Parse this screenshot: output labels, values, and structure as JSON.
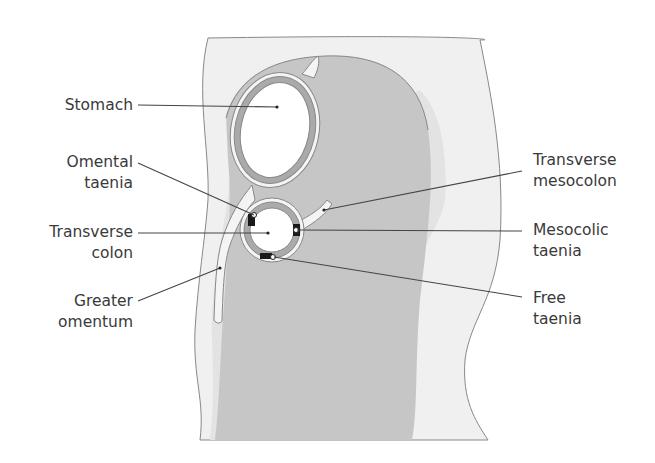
{
  "diagram": {
    "colors": {
      "background": "#ffffff",
      "outer_body": "#efefef",
      "outer_band": "#e2e2e2",
      "cavity": "#c4c4c4",
      "organ_wall": "#a9a9a9",
      "lumen": "#ffffff",
      "taenia": "#1a1a1a",
      "line": "#444444",
      "text": "#3a3a3a"
    }
  },
  "labels": {
    "stomach": {
      "line1": "Stomach",
      "line2": ""
    },
    "omental_taenia": {
      "line1": "Omental",
      "line2": "taenia"
    },
    "transverse_colon": {
      "line1": "Transverse",
      "line2": "colon"
    },
    "greater_omentum": {
      "line1": "Greater",
      "line2": "omentum"
    },
    "transverse_mesocolon": {
      "line1": "Transverse",
      "line2": "mesocolon"
    },
    "mesocolic_taenia": {
      "line1": "Mesocolic",
      "line2": "taenia"
    },
    "free_taenia": {
      "line1": "Free",
      "line2": "taenia"
    }
  }
}
